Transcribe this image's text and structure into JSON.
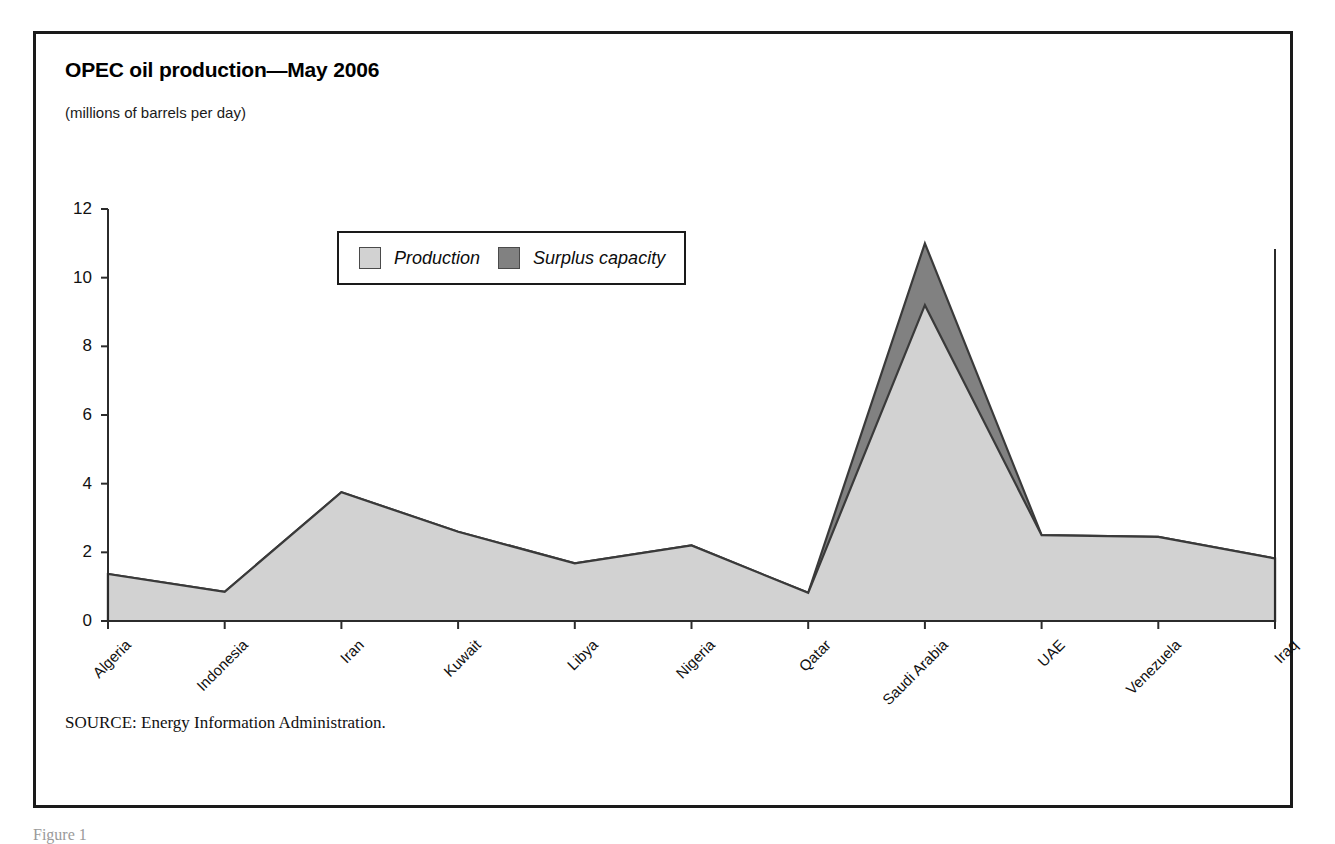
{
  "chart_data": {
    "type": "area",
    "title": "OPEC oil production—May 2006",
    "subtitle": "(millions of barrels per day)",
    "xlabel": "",
    "ylabel": "",
    "ylim": [
      0,
      12
    ],
    "yticks": [
      0,
      2,
      4,
      6,
      8,
      10,
      12
    ],
    "grid": false,
    "stacked": true,
    "legend_position": "inside-top-center",
    "categories": [
      "Algeria",
      "Indonesia",
      "Iran",
      "Kuwait",
      "Libya",
      "Nigeria",
      "Qatar",
      "Saudi Arabia",
      "UAE",
      "Venezuela",
      "Iraq"
    ],
    "series": [
      {
        "name": "Production",
        "color": "#d2d2d2",
        "values": [
          1.37,
          0.85,
          3.75,
          2.6,
          1.68,
          2.2,
          0.82,
          9.2,
          2.5,
          2.45,
          1.82
        ]
      },
      {
        "name": "Surplus capacity",
        "color": "#818181",
        "values": [
          0,
          0,
          0,
          0,
          0,
          0,
          0,
          1.8,
          0,
          0,
          0
        ]
      }
    ],
    "source": {
      "label": "SOURCE:",
      "text": "Energy Information Administration."
    }
  },
  "legend": {
    "items": [
      {
        "label": "Production",
        "color": "#d2d2d2"
      },
      {
        "label": "Surplus capacity",
        "color": "#818181"
      }
    ]
  },
  "caption": {
    "text": "Figure 1"
  },
  "colors": {
    "production_fill": "#d2d2d2",
    "surplus_fill": "#818181",
    "line": "#3a3a3a",
    "axis": "#2b2b2b",
    "frame": "#1a1a1a"
  }
}
